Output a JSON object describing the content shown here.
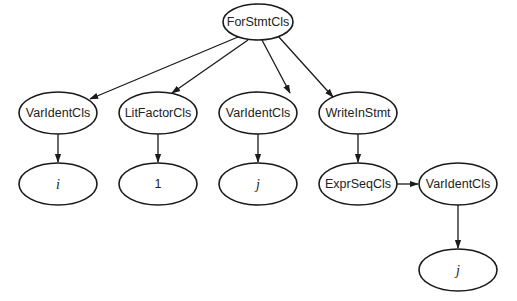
{
  "diagram": {
    "type": "tree",
    "nodes": [
      {
        "id": "n0",
        "label": "ForStmtCls",
        "italic": false,
        "cx": 258,
        "cy": 22,
        "rx": 35,
        "ry": 18
      },
      {
        "id": "n1",
        "label": "VarIdentCls",
        "italic": false,
        "cx": 58,
        "cy": 113,
        "rx": 39,
        "ry": 21
      },
      {
        "id": "n2",
        "label": "LitFactorCls",
        "italic": false,
        "cx": 158,
        "cy": 113,
        "rx": 39,
        "ry": 21
      },
      {
        "id": "n3",
        "label": "VarIdentCls",
        "italic": false,
        "cx": 258,
        "cy": 113,
        "rx": 39,
        "ry": 21
      },
      {
        "id": "n4",
        "label": "WriteInStmt",
        "italic": false,
        "cx": 358,
        "cy": 113,
        "rx": 39,
        "ry": 21
      },
      {
        "id": "n5",
        "label": "i",
        "italic": true,
        "cx": 58,
        "cy": 184,
        "rx": 39,
        "ry": 21
      },
      {
        "id": "n6",
        "label": "1",
        "italic": false,
        "cx": 158,
        "cy": 184,
        "rx": 39,
        "ry": 21
      },
      {
        "id": "n7",
        "label": "j",
        "italic": true,
        "cx": 258,
        "cy": 184,
        "rx": 39,
        "ry": 21
      },
      {
        "id": "n8",
        "label": "ExprSeqCls",
        "italic": false,
        "cx": 358,
        "cy": 184,
        "rx": 39,
        "ry": 21
      },
      {
        "id": "n9",
        "label": "VarIdentCls",
        "italic": false,
        "cx": 458,
        "cy": 184,
        "rx": 39,
        "ry": 21
      },
      {
        "id": "n10",
        "label": "j",
        "italic": true,
        "cx": 458,
        "cy": 270,
        "rx": 39,
        "ry": 21
      }
    ],
    "edges": [
      {
        "from": "n0",
        "to": "n1",
        "x1": 238,
        "y1": 37,
        "x2": 90,
        "y2": 99
      },
      {
        "from": "n0",
        "to": "n2",
        "x1": 248,
        "y1": 40,
        "x2": 172,
        "y2": 93
      },
      {
        "from": "n0",
        "to": "n3",
        "x1": 262,
        "y1": 40,
        "x2": 290,
        "y2": 93
      },
      {
        "from": "n0",
        "to": "n4",
        "x1": 278,
        "y1": 36,
        "x2": 333,
        "y2": 97
      },
      {
        "from": "n1",
        "to": "n5",
        "x1": 58,
        "y1": 134,
        "x2": 58,
        "y2": 162
      },
      {
        "from": "n2",
        "to": "n6",
        "x1": 158,
        "y1": 134,
        "x2": 158,
        "y2": 162
      },
      {
        "from": "n3",
        "to": "n7",
        "x1": 258,
        "y1": 134,
        "x2": 258,
        "y2": 162
      },
      {
        "from": "n4",
        "to": "n8",
        "x1": 358,
        "y1": 134,
        "x2": 358,
        "y2": 162
      },
      {
        "from": "n8",
        "to": "n9",
        "x1": 393,
        "y1": 184,
        "x2": 418,
        "y2": 184
      },
      {
        "from": "n9",
        "to": "n10",
        "x1": 458,
        "y1": 205,
        "x2": 458,
        "y2": 248
      }
    ]
  }
}
